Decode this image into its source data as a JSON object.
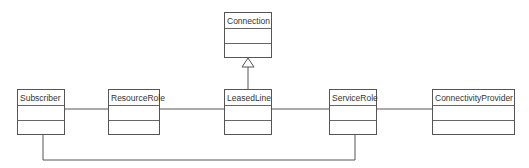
{
  "diagram": {
    "type": "UML class diagram",
    "classes": [
      {
        "id": "connection",
        "name": "Connection"
      },
      {
        "id": "subscriber",
        "name": "Subscriber"
      },
      {
        "id": "resource-role",
        "name": "ResourceRole"
      },
      {
        "id": "leased-line",
        "name": "LeasedLine"
      },
      {
        "id": "service-role",
        "name": "ServiceRole"
      },
      {
        "id": "connectivity-provider",
        "name": "ConnectivityProvider"
      }
    ],
    "relationships": [
      {
        "type": "generalization",
        "from": "LeasedLine",
        "to": "Connection"
      },
      {
        "type": "association",
        "from": "Subscriber",
        "to": "ResourceRole"
      },
      {
        "type": "association",
        "from": "ResourceRole",
        "to": "LeasedLine"
      },
      {
        "type": "association",
        "from": "LeasedLine",
        "to": "ServiceRole"
      },
      {
        "type": "association",
        "from": "ServiceRole",
        "to": "ConnectivityProvider"
      },
      {
        "type": "association",
        "from": "Subscriber",
        "to": "ServiceRole"
      }
    ],
    "colors": {
      "line": "#555555",
      "background": "#ffffff",
      "text": "#333333"
    }
  }
}
